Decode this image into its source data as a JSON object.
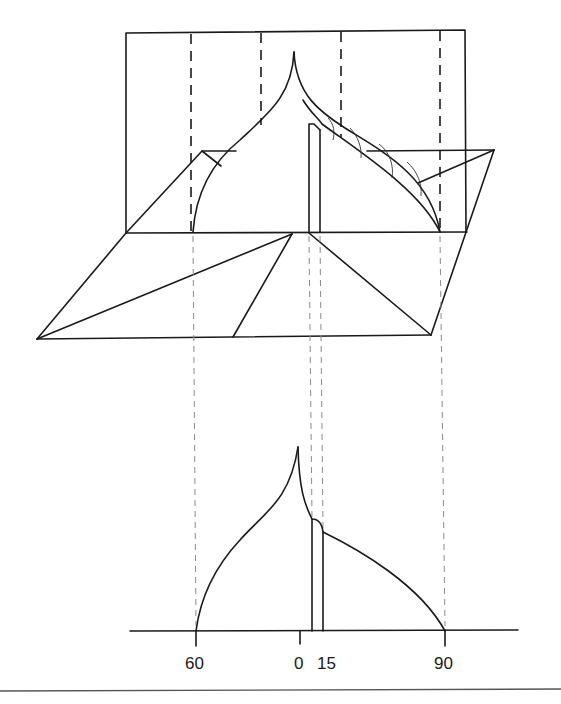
{
  "figure": {
    "type": "projection diagram",
    "colors": {
      "line": "#1a1a1a",
      "projection_dash": "#8a8a8a",
      "background": "#ffffff"
    }
  },
  "axis": {
    "labels": [
      {
        "text": "60",
        "x": 196
      },
      {
        "text": "0",
        "x": 300
      },
      {
        "text": "15",
        "x": 322
      },
      {
        "text": "90",
        "x": 445
      }
    ]
  }
}
